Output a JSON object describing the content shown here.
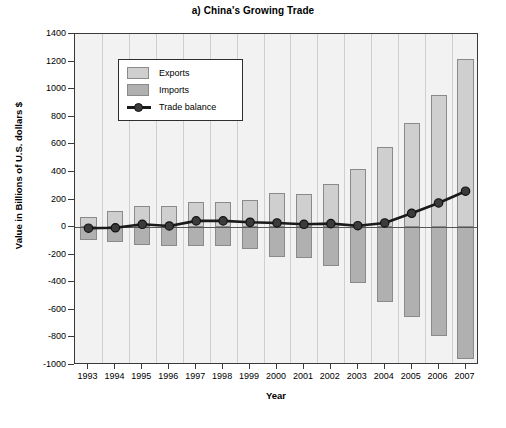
{
  "chart_data": {
    "type": "bar",
    "title": "a) China's Growing Trade",
    "xlabel": "Year",
    "ylabel": "Value in Billions of U.S. dollars $",
    "categories": [
      "1993",
      "1994",
      "1995",
      "1996",
      "1997",
      "1998",
      "1999",
      "2000",
      "2001",
      "2002",
      "2003",
      "2004",
      "2005",
      "2006",
      "2007"
    ],
    "ylim": [
      -1000,
      1400
    ],
    "yticks": [
      1400,
      1200,
      1000,
      800,
      600,
      400,
      200,
      0,
      -200,
      -400,
      -600,
      -800,
      -1000
    ],
    "ytick_labels": [
      "1400",
      "1200",
      "1000",
      "800",
      "600",
      "400",
      "200",
      "0",
      "-200",
      "-400",
      "-600",
      "-800",
      "-1000"
    ],
    "grid": "vertical",
    "legend_position": "upper-left-inside",
    "series": [
      {
        "name": "Exports",
        "color": "#cfcfcf",
        "direction": "up",
        "values": [
          75,
          120,
          150,
          150,
          185,
          185,
          195,
          245,
          240,
          310,
          420,
          580,
          755,
          960,
          1220
        ]
      },
      {
        "name": "Imports",
        "color": "#b0b0b0",
        "direction": "down",
        "values": [
          -95,
          -110,
          -130,
          -140,
          -140,
          -135,
          -160,
          -215,
          -225,
          -285,
          -405,
          -545,
          -655,
          -790,
          -960
        ]
      },
      {
        "name": "Trade balance",
        "color": "#1a1a1a",
        "type": "line",
        "marker": "circle",
        "values": [
          -8,
          -5,
          20,
          8,
          45,
          45,
          35,
          30,
          20,
          25,
          10,
          30,
          100,
          175,
          260
        ]
      }
    ]
  },
  "legend": {
    "items": [
      {
        "label": "Exports",
        "kind": "swatch"
      },
      {
        "label": "Imports",
        "kind": "swatch"
      },
      {
        "label": "Trade balance",
        "kind": "line-marker"
      }
    ]
  }
}
